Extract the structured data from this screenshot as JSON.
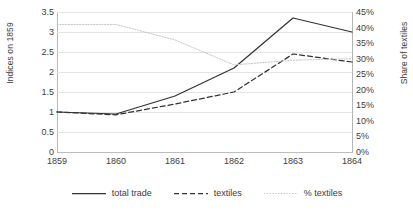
{
  "chart_data": {
    "type": "line",
    "title": "",
    "xlabel": "",
    "ylabel": "Indices on 1859",
    "y2label": "Share of textiles",
    "categories": [
      "1859",
      "1860",
      "1861",
      "1862",
      "1863",
      "1864"
    ],
    "x": [
      1859,
      1860,
      1861,
      1862,
      1863,
      1864
    ],
    "ylim": [
      0,
      3.5
    ],
    "y2lim": [
      0,
      45
    ],
    "yticks": [
      "0",
      "0.5",
      "1",
      "1.5",
      "2",
      "2.5",
      "3",
      "3.5"
    ],
    "ytick_values": [
      0,
      0.5,
      1,
      1.5,
      2,
      2.5,
      3,
      3.5
    ],
    "y2ticks": [
      "0%",
      "5%",
      "10%",
      "15%",
      "20%",
      "25%",
      "30%",
      "35%",
      "40%",
      "45%"
    ],
    "y2tick_values": [
      0,
      5,
      10,
      15,
      20,
      25,
      30,
      35,
      40,
      45
    ],
    "grid": true,
    "legend_position": "bottom",
    "series": [
      {
        "name": "total trade",
        "axis": "left",
        "style": "solid",
        "color": "#333333",
        "values": [
          1.0,
          0.95,
          1.4,
          2.1,
          3.35,
          3.0
        ]
      },
      {
        "name": "textiles",
        "axis": "left",
        "style": "dashed",
        "color": "#333333",
        "values": [
          1.0,
          0.93,
          1.2,
          1.5,
          2.45,
          2.25
        ]
      },
      {
        "name": "% textiles",
        "axis": "right",
        "style": "dotted",
        "color": "#c8c8c8",
        "values": [
          41.0,
          41.0,
          36.0,
          28.0,
          29.5,
          30.0
        ]
      }
    ]
  },
  "legend": {
    "items": [
      {
        "label": "total trade"
      },
      {
        "label": "textiles"
      },
      {
        "label": "% textiles"
      }
    ]
  },
  "colors": {
    "grid": "#e3e3e3",
    "axis": "#b5b5b5",
    "text": "#3d3d3d",
    "background": "#ffffff"
  }
}
